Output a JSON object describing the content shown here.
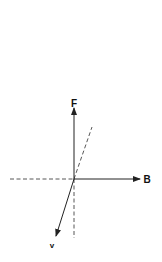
{
  "diagram": {
    "type": "vector-diagram",
    "origin": [
      74,
      179
    ],
    "vectors": [
      {
        "id": "F",
        "label": "F",
        "from": [
          74,
          179
        ],
        "to": [
          74,
          108
        ],
        "style": "solid-arrow"
      },
      {
        "id": "B",
        "label": "B",
        "from": [
          74,
          179
        ],
        "to": [
          140,
          179
        ],
        "style": "solid-arrow"
      },
      {
        "id": "v",
        "label": "v",
        "from": [
          74,
          179
        ],
        "to": [
          56,
          236
        ],
        "style": "solid-arrow"
      }
    ],
    "guides": [
      {
        "id": "horizontal-dashed",
        "from": [
          10,
          179
        ],
        "to": [
          74,
          179
        ],
        "style": "dashed"
      },
      {
        "id": "vertical-dashed",
        "from": [
          74,
          179
        ],
        "to": [
          74,
          238
        ],
        "style": "dashed"
      },
      {
        "id": "diagonal-dashed",
        "from": [
          74,
          179
        ],
        "to": [
          92,
          127
        ],
        "style": "dashed"
      }
    ],
    "labels": {
      "F": "F",
      "B": "B",
      "v": "v"
    },
    "colors": {
      "line": "#222222",
      "background": "#ffffff"
    }
  }
}
